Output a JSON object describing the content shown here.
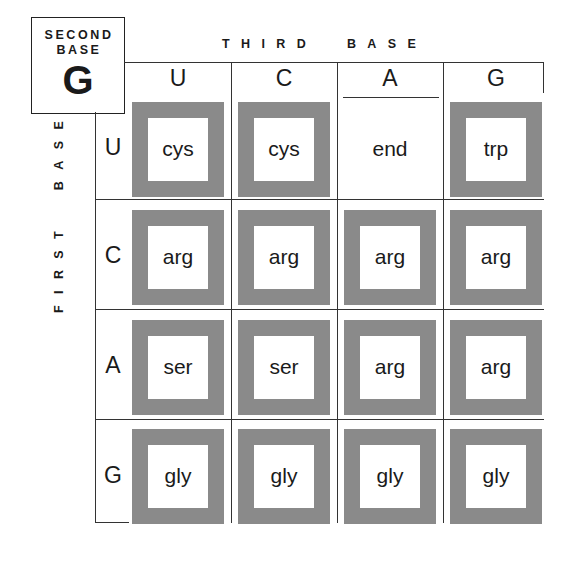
{
  "title_box": {
    "label_line1": "SECOND",
    "label_line2": "BASE",
    "letter": "G"
  },
  "axis": {
    "third_base_label": "THIRD  BASE",
    "first_base_label": "FIRST  BASE"
  },
  "columns": [
    "U",
    "C",
    "A",
    "G"
  ],
  "rows": [
    {
      "letter": "U",
      "cells": [
        {
          "text": "cys",
          "boxed": true
        },
        {
          "text": "cys",
          "boxed": true
        },
        {
          "text": "end",
          "boxed": false
        },
        {
          "text": "trp",
          "boxed": true
        }
      ]
    },
    {
      "letter": "C",
      "cells": [
        {
          "text": "arg",
          "boxed": true
        },
        {
          "text": "arg",
          "boxed": true
        },
        {
          "text": "arg",
          "boxed": true
        },
        {
          "text": "arg",
          "boxed": true
        }
      ]
    },
    {
      "letter": "A",
      "cells": [
        {
          "text": "ser",
          "boxed": true
        },
        {
          "text": "ser",
          "boxed": true
        },
        {
          "text": "arg",
          "boxed": true
        },
        {
          "text": "arg",
          "boxed": true
        }
      ]
    },
    {
      "letter": "G",
      "cells": [
        {
          "text": "gly",
          "boxed": true
        },
        {
          "text": "gly",
          "boxed": true
        },
        {
          "text": "gly",
          "boxed": true
        },
        {
          "text": "gly",
          "boxed": true
        }
      ]
    }
  ],
  "colors": {
    "box_border": "#8a8a8a",
    "line": "#333333",
    "background": "#ffffff"
  }
}
